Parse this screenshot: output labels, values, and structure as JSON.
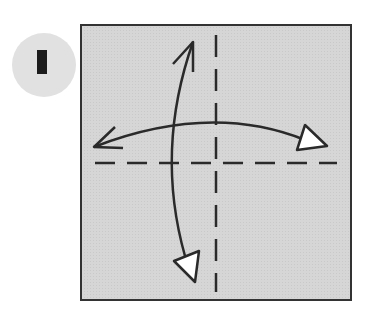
{
  "step": {
    "number": "1",
    "badge_color": "#e1e1e1",
    "numeral_color": "#1c1c1c"
  },
  "diagram": {
    "paper": {
      "x": 81,
      "y": 25,
      "width": 270,
      "height": 275,
      "fill": "#d4d4d4",
      "stroke": "#333333"
    },
    "fold_lines": [
      {
        "type": "valley-fold",
        "orientation": "vertical",
        "x": 216,
        "y1": 35,
        "y2": 292
      },
      {
        "type": "valley-fold",
        "orientation": "horizontal",
        "y": 163,
        "x1": 95,
        "x2": 337
      }
    ],
    "arrows": [
      {
        "name": "fold-unfold-horizontal",
        "from": [
          93,
          147
        ],
        "to": [
          327,
          146
        ],
        "start_head": "open",
        "end_head": "hollow-triangle"
      },
      {
        "name": "fold-unfold-vertical",
        "from": [
          193,
          41
        ],
        "to": [
          195,
          282
        ],
        "start_head": "open",
        "end_head": "hollow-triangle"
      }
    ]
  }
}
